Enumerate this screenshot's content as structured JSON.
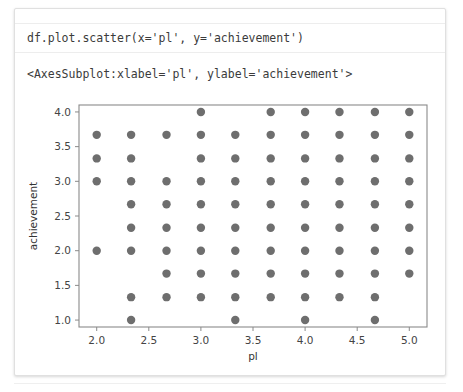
{
  "notebook": {
    "code": "df.plot.scatter(x='pl', y='achievement')",
    "output": "<AxesSubplot:xlabel='pl', ylabel='achievement'>"
  },
  "chart_data": {
    "type": "scatter",
    "title": "",
    "xlabel": "pl",
    "ylabel": "achievement",
    "xlim": [
      1.83,
      5.17
    ],
    "ylim": [
      0.9,
      4.1
    ],
    "xticks": [
      "2.0",
      "2.5",
      "3.0",
      "3.5",
      "4.0",
      "4.5",
      "5.0"
    ],
    "xtick_values": [
      2.0,
      2.5,
      3.0,
      3.5,
      4.0,
      4.5,
      5.0
    ],
    "yticks": [
      "1.0",
      "1.5",
      "2.0",
      "2.5",
      "3.0",
      "3.5",
      "4.0"
    ],
    "ytick_values": [
      1.0,
      1.5,
      2.0,
      2.5,
      3.0,
      3.5,
      4.0
    ],
    "grid": false,
    "legend": false,
    "marker_color": "#6e6e6e",
    "marker_size": 4.2,
    "points": [
      [
        3.0,
        4.0
      ],
      [
        3.67,
        4.0
      ],
      [
        4.0,
        4.0
      ],
      [
        4.33,
        4.0
      ],
      [
        4.67,
        4.0
      ],
      [
        5.0,
        4.0
      ],
      [
        2.0,
        3.67
      ],
      [
        2.33,
        3.67
      ],
      [
        2.67,
        3.67
      ],
      [
        3.0,
        3.67
      ],
      [
        3.33,
        3.67
      ],
      [
        3.67,
        3.67
      ],
      [
        4.0,
        3.67
      ],
      [
        4.33,
        3.67
      ],
      [
        4.67,
        3.67
      ],
      [
        5.0,
        3.67
      ],
      [
        2.0,
        3.33
      ],
      [
        2.33,
        3.33
      ],
      [
        3.0,
        3.33
      ],
      [
        3.33,
        3.33
      ],
      [
        3.67,
        3.33
      ],
      [
        4.0,
        3.33
      ],
      [
        4.33,
        3.33
      ],
      [
        4.67,
        3.33
      ],
      [
        5.0,
        3.33
      ],
      [
        2.0,
        3.0
      ],
      [
        2.33,
        3.0
      ],
      [
        2.67,
        3.0
      ],
      [
        3.0,
        3.0
      ],
      [
        3.33,
        3.0
      ],
      [
        3.67,
        3.0
      ],
      [
        4.0,
        3.0
      ],
      [
        4.33,
        3.0
      ],
      [
        4.67,
        3.0
      ],
      [
        5.0,
        3.0
      ],
      [
        2.33,
        2.67
      ],
      [
        2.67,
        2.67
      ],
      [
        3.0,
        2.67
      ],
      [
        3.33,
        2.67
      ],
      [
        3.67,
        2.67
      ],
      [
        4.0,
        2.67
      ],
      [
        4.33,
        2.67
      ],
      [
        4.67,
        2.67
      ],
      [
        5.0,
        2.67
      ],
      [
        2.33,
        2.33
      ],
      [
        2.67,
        2.33
      ],
      [
        3.0,
        2.33
      ],
      [
        3.33,
        2.33
      ],
      [
        3.67,
        2.33
      ],
      [
        4.0,
        2.33
      ],
      [
        4.33,
        2.33
      ],
      [
        4.67,
        2.33
      ],
      [
        5.0,
        2.33
      ],
      [
        2.0,
        2.0
      ],
      [
        2.33,
        2.0
      ],
      [
        2.67,
        2.0
      ],
      [
        3.0,
        2.0
      ],
      [
        3.33,
        2.0
      ],
      [
        3.67,
        2.0
      ],
      [
        4.0,
        2.0
      ],
      [
        4.33,
        2.0
      ],
      [
        4.67,
        2.0
      ],
      [
        5.0,
        2.0
      ],
      [
        2.67,
        1.67
      ],
      [
        3.0,
        1.67
      ],
      [
        3.33,
        1.67
      ],
      [
        3.67,
        1.67
      ],
      [
        4.0,
        1.67
      ],
      [
        4.33,
        1.67
      ],
      [
        4.67,
        1.67
      ],
      [
        5.0,
        1.67
      ],
      [
        2.33,
        1.33
      ],
      [
        2.67,
        1.33
      ],
      [
        3.0,
        1.33
      ],
      [
        3.33,
        1.33
      ],
      [
        3.67,
        1.33
      ],
      [
        4.0,
        1.33
      ],
      [
        4.33,
        1.33
      ],
      [
        4.67,
        1.33
      ],
      [
        2.33,
        1.0
      ],
      [
        3.33,
        1.0
      ],
      [
        4.0,
        1.0
      ],
      [
        4.67,
        1.0
      ]
    ]
  }
}
